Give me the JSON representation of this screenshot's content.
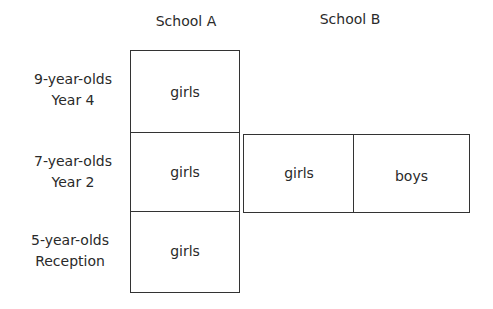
{
  "columns": {
    "school_a": "School A",
    "school_b": "School B"
  },
  "rows": [
    {
      "age": "9-year-olds",
      "year": "Year 4"
    },
    {
      "age": "7-year-olds",
      "year": "Year 2"
    },
    {
      "age": "5-year-olds",
      "year": "Reception"
    }
  ],
  "school_a_cells": [
    "girls",
    "girls",
    "girls"
  ],
  "school_b_cells": [
    "girls",
    "boys"
  ],
  "colors": {
    "line": "#333333",
    "text": "#2a2a2a",
    "background": "#ffffff"
  }
}
